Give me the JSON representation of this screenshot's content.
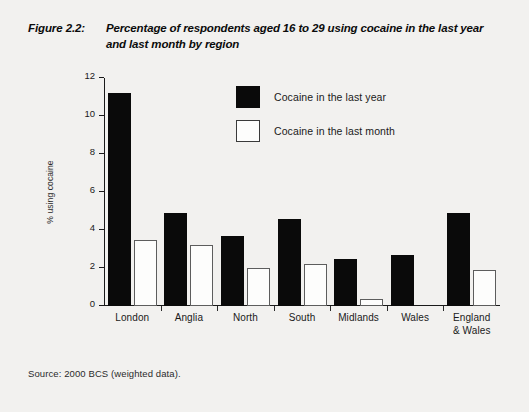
{
  "figure": {
    "label": "Figure 2.2:",
    "title": "Percentage of respondents aged 16 to 29 using cocaine in the last year and last month by region"
  },
  "source": {
    "note": "Source:  2000 BCS (weighted data)."
  },
  "legend": {
    "position": "top-center",
    "items": [
      {
        "name": "Cocaine in the last year",
        "color": "#0a0a0a"
      },
      {
        "name": "Cocaine in the last month",
        "color": "#ffffff"
      }
    ]
  },
  "axes": {
    "ylabel": "% using cocaine",
    "xlabel": "",
    "yticks": [
      0,
      2,
      4,
      6,
      8,
      10,
      12
    ],
    "ytick_labels": [
      "0",
      "2",
      "4",
      "6",
      "8",
      "10",
      "12"
    ]
  },
  "chart_data": {
    "type": "bar",
    "title": "Percentage of respondents aged 16 to 29 using cocaine in the last year and last month by region",
    "xlabel": "",
    "ylabel": "% using cocaine",
    "ylim": [
      0,
      12
    ],
    "grid": false,
    "legend_position": "top-center",
    "categories": [
      "London",
      "Anglia",
      "North",
      "South",
      "Midlands",
      "Wales",
      "England & Wales"
    ],
    "series": [
      {
        "name": "Cocaine in the last year",
        "color": "#0a0a0a",
        "values": [
          11.2,
          4.9,
          3.7,
          4.6,
          2.5,
          2.7,
          4.9
        ]
      },
      {
        "name": "Cocaine in the last month",
        "color": "#ffffff",
        "values": [
          3.5,
          3.2,
          2.0,
          2.2,
          0.35,
          0.0,
          1.9
        ]
      }
    ],
    "source": "2000 BCS (weighted data)."
  }
}
